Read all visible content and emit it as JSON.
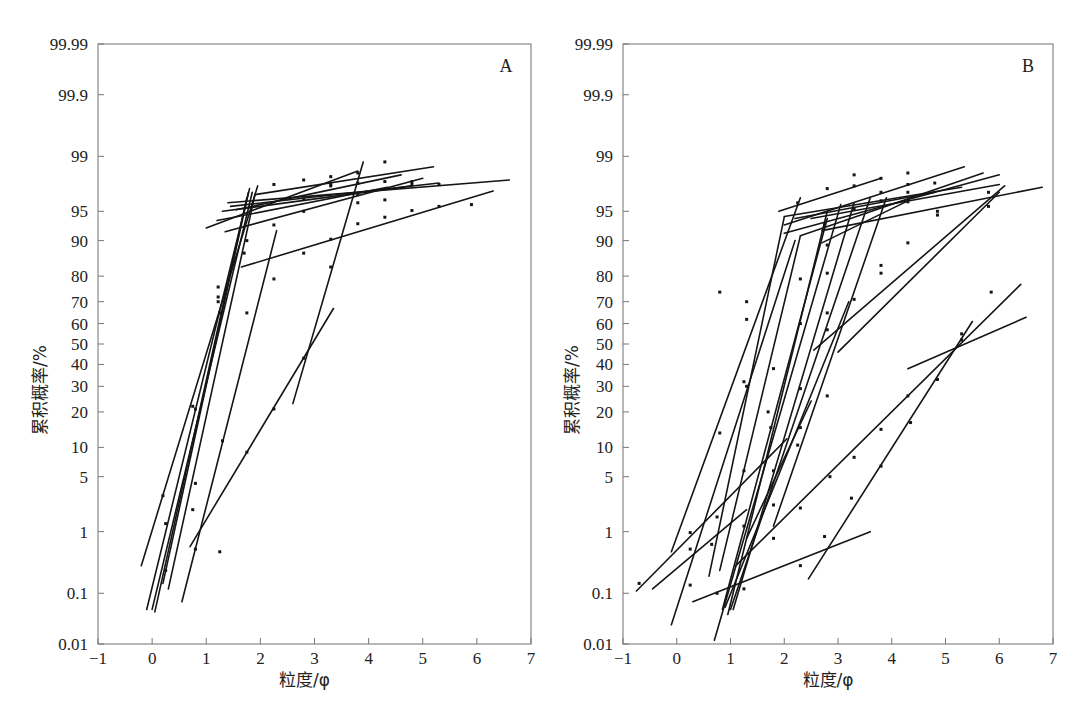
{
  "chart_data": [
    {
      "type": "line",
      "panel": "A",
      "title": "",
      "xlabel": "粒度/φ",
      "ylabel": "累积概率/%",
      "yscale": "probability",
      "xlim": [
        -1,
        7
      ],
      "ylim": [
        0.01,
        99.99
      ],
      "xticks": [
        "-1",
        "0",
        "1",
        "2",
        "3",
        "4",
        "5",
        "6",
        "7"
      ],
      "xtick_values": [
        -1,
        0,
        1,
        2,
        3,
        4,
        5,
        6,
        7
      ],
      "yticks": [
        "0.01",
        "0.1",
        "1",
        "5",
        "10",
        "20",
        "30",
        "40",
        "50",
        "60",
        "70",
        "80",
        "90",
        "95",
        "99",
        "99.9",
        "99.99"
      ],
      "ytick_values": [
        0.01,
        0.1,
        1,
        5,
        10,
        20,
        30,
        40,
        50,
        60,
        70,
        80,
        90,
        95,
        99,
        99.9,
        99.99
      ],
      "grid": false,
      "panel_label": "A",
      "series": [
        {
          "name": "A-steep-1",
          "x": [
            -0.2,
            1.95
          ],
          "y": [
            0.3,
            97.5
          ]
        },
        {
          "name": "A-steep-2",
          "x": [
            -0.1,
            1.8
          ],
          "y": [
            0.05,
            97.3
          ]
        },
        {
          "name": "A-steep-3",
          "x": [
            0.0,
            1.85
          ],
          "y": [
            0.05,
            97.0
          ]
        },
        {
          "name": "A-steep-4",
          "x": [
            0.05,
            1.75
          ],
          "y": [
            0.045,
            96.5
          ]
        },
        {
          "name": "A-steep-5",
          "x": [
            0.2,
            1.78
          ],
          "y": [
            0.15,
            97.0
          ]
        },
        {
          "name": "A-steep-6",
          "x": [
            0.3,
            1.9
          ],
          "y": [
            0.12,
            96.8
          ]
        },
        {
          "name": "A-mid-1",
          "x": [
            0.55,
            2.3
          ],
          "y": [
            0.07,
            92.0
          ]
        },
        {
          "name": "A-fine-1",
          "x": [
            2.6,
            3.9
          ],
          "y": [
            23,
            98.8
          ]
        },
        {
          "name": "A-tail-1",
          "x": [
            0.7,
            3.35
          ],
          "y": [
            0.6,
            67
          ]
        },
        {
          "name": "A-upper-1",
          "x": [
            1.0,
            3.8
          ],
          "y": [
            92.5,
            98.4
          ]
        },
        {
          "name": "A-upper-2",
          "x": [
            1.35,
            5.0
          ],
          "y": [
            91.8,
            98.0
          ]
        },
        {
          "name": "A-upper-3",
          "x": [
            1.2,
            4.35
          ],
          "y": [
            93.7,
            97.4
          ]
        },
        {
          "name": "A-upper-4",
          "x": [
            1.3,
            4.8
          ],
          "y": [
            95.0,
            97.5
          ]
        },
        {
          "name": "A-upper-5",
          "x": [
            1.45,
            5.3
          ],
          "y": [
            95.6,
            97.7
          ]
        },
        {
          "name": "A-upper-6",
          "x": [
            1.4,
            6.6
          ],
          "y": [
            96.0,
            97.9
          ]
        },
        {
          "name": "A-upper-7",
          "x": [
            1.9,
            5.2
          ],
          "y": [
            96.8,
            98.6
          ]
        },
        {
          "name": "A-upper-8",
          "x": [
            1.55,
            4.6
          ],
          "y": [
            95.2,
            98.2
          ]
        },
        {
          "name": "A-fine-2",
          "x": [
            1.65,
            6.3
          ],
          "y": [
            83,
            97.1
          ]
        }
      ],
      "points": [
        {
          "x": 0.2,
          "y": 3.0
        },
        {
          "x": 0.25,
          "y": 1.3
        },
        {
          "x": 0.25,
          "y": 0.25
        },
        {
          "x": 0.75,
          "y": 22
        },
        {
          "x": 0.8,
          "y": 21
        },
        {
          "x": 0.8,
          "y": 4.2
        },
        {
          "x": 0.75,
          "y": 2.0
        },
        {
          "x": 0.8,
          "y": 0.55
        },
        {
          "x": 1.25,
          "y": 0.5
        },
        {
          "x": 1.3,
          "y": 11.5
        },
        {
          "x": 1.22,
          "y": 76
        },
        {
          "x": 1.22,
          "y": 72
        },
        {
          "x": 1.22,
          "y": 70
        },
        {
          "x": 1.25,
          "y": 65
        },
        {
          "x": 1.75,
          "y": 9
        },
        {
          "x": 2.25,
          "y": 21
        },
        {
          "x": 2.8,
          "y": 43
        },
        {
          "x": 1.7,
          "y": 87
        },
        {
          "x": 1.75,
          "y": 90
        },
        {
          "x": 1.75,
          "y": 65
        },
        {
          "x": 2.25,
          "y": 93
        },
        {
          "x": 2.25,
          "y": 79
        },
        {
          "x": 2.25,
          "y": 97.6
        },
        {
          "x": 3.3,
          "y": 98.1
        },
        {
          "x": 3.3,
          "y": 97.6
        },
        {
          "x": 3.8,
          "y": 98.3
        },
        {
          "x": 2.8,
          "y": 97.9
        },
        {
          "x": 2.8,
          "y": 96.4
        },
        {
          "x": 2.8,
          "y": 95.0
        },
        {
          "x": 3.3,
          "y": 97.5
        },
        {
          "x": 3.8,
          "y": 97.7
        },
        {
          "x": 4.3,
          "y": 96.3
        },
        {
          "x": 4.3,
          "y": 98.8
        },
        {
          "x": 4.3,
          "y": 97.8
        },
        {
          "x": 4.8,
          "y": 97.8
        },
        {
          "x": 4.8,
          "y": 97.6
        },
        {
          "x": 3.8,
          "y": 96.8
        },
        {
          "x": 3.8,
          "y": 96.0
        },
        {
          "x": 2.8,
          "y": 87
        },
        {
          "x": 3.3,
          "y": 90.3
        },
        {
          "x": 3.8,
          "y": 93.2
        },
        {
          "x": 4.3,
          "y": 94.2
        },
        {
          "x": 4.8,
          "y": 95.1
        },
        {
          "x": 5.3,
          "y": 95.6
        },
        {
          "x": 5.9,
          "y": 95.8
        },
        {
          "x": 5.3,
          "y": 97.6
        },
        {
          "x": 3.3,
          "y": 83
        }
      ]
    },
    {
      "type": "line",
      "panel": "B",
      "title": "",
      "xlabel": "粒度/φ",
      "ylabel": "累积概率/%",
      "yscale": "probability",
      "xlim": [
        -1,
        7
      ],
      "ylim": [
        0.01,
        99.99
      ],
      "xticks": [
        "-1",
        "0",
        "1",
        "2",
        "3",
        "4",
        "5",
        "6",
        "7"
      ],
      "xtick_values": [
        -1,
        0,
        1,
        2,
        3,
        4,
        5,
        6,
        7
      ],
      "yticks": [
        "0.01",
        "0.1",
        "1",
        "5",
        "10",
        "20",
        "30",
        "40",
        "50",
        "60",
        "70",
        "80",
        "90",
        "95",
        "99",
        "99.9",
        "99.99"
      ],
      "ytick_values": [
        0.01,
        0.1,
        1,
        5,
        10,
        20,
        30,
        40,
        50,
        60,
        70,
        80,
        90,
        95,
        99,
        99.9,
        99.99
      ],
      "grid": false,
      "panel_label": "B",
      "series": [
        {
          "name": "B-1",
          "x": [
            -0.1,
            2.3
          ],
          "y": [
            0.5,
            96.5
          ]
        },
        {
          "name": "B-2",
          "x": [
            0.6,
            2.0
          ],
          "y": [
            0.2,
            94.2
          ]
        },
        {
          "name": "B-3",
          "x": [
            -0.75,
            2.05
          ],
          "y": [
            0.11,
            12
          ]
        },
        {
          "name": "B-4",
          "x": [
            -0.45,
            1.3
          ],
          "y": [
            0.12,
            2.0
          ]
        },
        {
          "name": "B-5",
          "x": [
            -0.1,
            2.2
          ],
          "y": [
            0.025,
            90
          ]
        },
        {
          "name": "B-6",
          "x": [
            0.8,
            2.3
          ],
          "y": [
            0.25,
            91
          ]
        },
        {
          "name": "B-7",
          "x": [
            0.7,
            3.05
          ],
          "y": [
            0.012,
            95.8
          ]
        },
        {
          "name": "B-8",
          "x": [
            0.85,
            2.8
          ],
          "y": [
            0.05,
            94
          ]
        },
        {
          "name": "B-9",
          "x": [
            0.95,
            2.8
          ],
          "y": [
            0.04,
            95
          ]
        },
        {
          "name": "B-10",
          "x": [
            1.0,
            3.6
          ],
          "y": [
            0.05,
            96.5
          ]
        },
        {
          "name": "B-11",
          "x": [
            0.9,
            3.2
          ],
          "y": [
            0.055,
            70
          ]
        },
        {
          "name": "B-12",
          "x": [
            1.05,
            3.3
          ],
          "y": [
            0.05,
            96
          ]
        },
        {
          "name": "B-13",
          "x": [
            1.8,
            3.9
          ],
          "y": [
            1.2,
            96.5
          ]
        },
        {
          "name": "B-14",
          "x": [
            1.3,
            2.5
          ],
          "y": [
            0.8,
            24
          ]
        },
        {
          "name": "B-15",
          "x": [
            0.3,
            3.6
          ],
          "y": [
            0.07,
            1.0
          ]
        },
        {
          "name": "B-16",
          "x": [
            2.45,
            5.5
          ],
          "y": [
            0.18,
            61
          ]
        },
        {
          "name": "B-17",
          "x": [
            1.1,
            6.4
          ],
          "y": [
            0.3,
            77
          ]
        },
        {
          "name": "B-18",
          "x": [
            4.3,
            6.5
          ],
          "y": [
            38,
            63
          ]
        },
        {
          "name": "B-19",
          "x": [
            2.55,
            6.1
          ],
          "y": [
            47,
            97.5
          ]
        },
        {
          "name": "B-20",
          "x": [
            3.0,
            6.0
          ],
          "y": [
            46,
            97.0
          ]
        },
        {
          "name": "B-21",
          "x": [
            2.0,
            5.35
          ],
          "y": [
            93.0,
            98.6
          ]
        },
        {
          "name": "B-22",
          "x": [
            2.0,
            6.0
          ],
          "y": [
            91.5,
            98.2
          ]
        },
        {
          "name": "B-23",
          "x": [
            2.3,
            5.7
          ],
          "y": [
            91.0,
            98.3
          ]
        },
        {
          "name": "B-24",
          "x": [
            2.5,
            6.0
          ],
          "y": [
            94.0,
            97.6
          ]
        },
        {
          "name": "B-25",
          "x": [
            2.7,
            6.8
          ],
          "y": [
            92.0,
            97.4
          ]
        },
        {
          "name": "B-26",
          "x": [
            2.0,
            5.3
          ],
          "y": [
            94.3,
            97.4
          ]
        },
        {
          "name": "B-27",
          "x": [
            2.2,
            4.8
          ],
          "y": [
            94.0,
            97.0
          ]
        },
        {
          "name": "B-28",
          "x": [
            2.7,
            4.3
          ],
          "y": [
            89.5,
            96.2
          ]
        },
        {
          "name": "B-29",
          "x": [
            1.9,
            3.8
          ],
          "y": [
            95.0,
            98.0
          ]
        }
      ],
      "points": [
        {
          "x": -0.7,
          "y": 0.15
        },
        {
          "x": 0.25,
          "y": 0.55
        },
        {
          "x": 0.25,
          "y": 0.97
        },
        {
          "x": 0.25,
          "y": 0.14
        },
        {
          "x": 0.65,
          "y": 0.65
        },
        {
          "x": 0.75,
          "y": 0.1
        },
        {
          "x": 0.75,
          "y": 1.6
        },
        {
          "x": 0.8,
          "y": 13.5
        },
        {
          "x": 1.25,
          "y": 32
        },
        {
          "x": 1.3,
          "y": 30
        },
        {
          "x": 1.25,
          "y": 5.8
        },
        {
          "x": 1.25,
          "y": 1.2
        },
        {
          "x": 1.25,
          "y": 0.12
        },
        {
          "x": 1.7,
          "y": 20
        },
        {
          "x": 1.75,
          "y": 15
        },
        {
          "x": 1.8,
          "y": 38
        },
        {
          "x": 1.8,
          "y": 5.8
        },
        {
          "x": 1.8,
          "y": 2.3
        },
        {
          "x": 1.8,
          "y": 0.8
        },
        {
          "x": 2.3,
          "y": 29
        },
        {
          "x": 2.3,
          "y": 15
        },
        {
          "x": 2.25,
          "y": 10.5
        },
        {
          "x": 2.3,
          "y": 2.1
        },
        {
          "x": 2.3,
          "y": 0.3
        },
        {
          "x": 2.8,
          "y": 26
        },
        {
          "x": 2.85,
          "y": 5
        },
        {
          "x": 2.75,
          "y": 0.85
        },
        {
          "x": 3.3,
          "y": 8
        },
        {
          "x": 3.25,
          "y": 2.8
        },
        {
          "x": 3.8,
          "y": 14.5
        },
        {
          "x": 3.8,
          "y": 6.5
        },
        {
          "x": 4.3,
          "y": 26
        },
        {
          "x": 4.35,
          "y": 16.5
        },
        {
          "x": 4.85,
          "y": 33
        },
        {
          "x": 5.3,
          "y": 55
        },
        {
          "x": 5.3,
          "y": 52
        },
        {
          "x": 5.85,
          "y": 74
        },
        {
          "x": 0.8,
          "y": 74
        },
        {
          "x": 1.3,
          "y": 70
        },
        {
          "x": 1.3,
          "y": 62
        },
        {
          "x": 2.3,
          "y": 79
        },
        {
          "x": 2.3,
          "y": 60
        },
        {
          "x": 2.8,
          "y": 65
        },
        {
          "x": 2.8,
          "y": 57
        },
        {
          "x": 2.8,
          "y": 81
        },
        {
          "x": 2.8,
          "y": 89
        },
        {
          "x": 2.75,
          "y": 93
        },
        {
          "x": 3.3,
          "y": 71
        },
        {
          "x": 3.8,
          "y": 83.5
        },
        {
          "x": 3.8,
          "y": 81
        },
        {
          "x": 4.3,
          "y": 89.5
        },
        {
          "x": 4.85,
          "y": 95
        },
        {
          "x": 4.85,
          "y": 94.5
        },
        {
          "x": 5.8,
          "y": 95.6
        },
        {
          "x": 5.8,
          "y": 97.0
        },
        {
          "x": 2.25,
          "y": 96.0
        },
        {
          "x": 2.8,
          "y": 97.3
        },
        {
          "x": 3.3,
          "y": 97.5
        },
        {
          "x": 3.3,
          "y": 95.3
        },
        {
          "x": 3.8,
          "y": 98.0
        },
        {
          "x": 3.8,
          "y": 97.0
        },
        {
          "x": 3.8,
          "y": 96.2
        },
        {
          "x": 4.3,
          "y": 98.3
        },
        {
          "x": 4.3,
          "y": 97.6
        },
        {
          "x": 4.3,
          "y": 97.0
        },
        {
          "x": 4.3,
          "y": 96.1
        },
        {
          "x": 4.8,
          "y": 97.7
        },
        {
          "x": 3.3,
          "y": 98.2
        }
      ]
    }
  ]
}
